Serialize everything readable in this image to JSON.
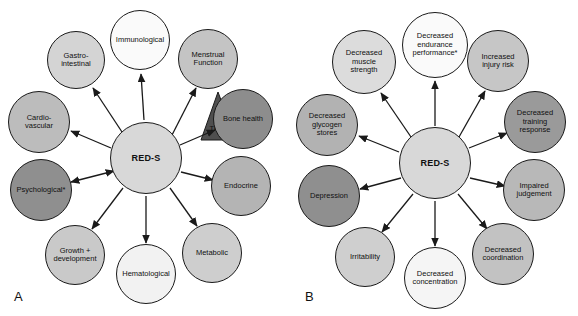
{
  "figure": {
    "type": "concept-diagram",
    "background_color": "#ffffff",
    "outline_color": "#1a1a1a"
  },
  "panels": [
    {
      "letter": "A",
      "letter_x": 14,
      "letter_y": 289,
      "center": {
        "label": "RED-S",
        "cx": 146,
        "cy": 158,
        "r": 36,
        "fill": "#d8d8d8",
        "font_size": 9
      },
      "overlay": {
        "name": "triad-triangle",
        "label": "Triad",
        "fill": "#4f4f4f",
        "text_color": "#1a1a1a",
        "points": "201,140 236,140 218,92",
        "label_x": 218,
        "label_y": 128,
        "font_size": 7.5
      },
      "nodes": [
        {
          "label": "Immunological",
          "cx": 140,
          "cy": 40,
          "r": 30,
          "fill": "#fafafa",
          "font_size": 7.5,
          "arrow": "single",
          "arrow_from": [
            144,
            120
          ],
          "arrow_to": [
            141,
            74
          ]
        },
        {
          "label": "Gastro-\nintestinal",
          "cx": 76,
          "cy": 60,
          "r": 29,
          "fill": "#d4d4d4",
          "font_size": 7.5,
          "arrow": "single",
          "arrow_from": [
            122,
            132
          ],
          "arrow_to": [
            93,
            88
          ]
        },
        {
          "label": "Cardio-\nvascular",
          "cx": 39,
          "cy": 122,
          "r": 31,
          "fill": "#bcbcbc",
          "font_size": 7.5,
          "arrow": "single",
          "arrow_from": [
            111,
            148
          ],
          "arrow_to": [
            71,
            131
          ]
        },
        {
          "label": "Psychological*",
          "cx": 41,
          "cy": 190,
          "r": 31,
          "fill": "#8f8f8f",
          "font_size": 7.5,
          "arrow": "double",
          "arrow_from": [
            71,
            182
          ],
          "arrow_to": [
            114,
            171
          ]
        },
        {
          "label": "Growth +\ndevelopment",
          "cx": 75,
          "cy": 255,
          "r": 30,
          "fill": "#c9c9c9",
          "font_size": 7.5,
          "arrow": "single",
          "arrow_from": [
            123,
            188
          ],
          "arrow_to": [
            92,
            229
          ]
        },
        {
          "label": "Hematological",
          "cx": 146,
          "cy": 274,
          "r": 30,
          "fill": "#f2f2f2",
          "font_size": 7.5,
          "arrow": "single",
          "arrow_from": [
            146,
            196
          ],
          "arrow_to": [
            146,
            243
          ]
        },
        {
          "label": "Metabolic",
          "cx": 212,
          "cy": 253,
          "r": 30,
          "fill": "#cecece",
          "font_size": 7.5,
          "arrow": "single",
          "arrow_from": [
            170,
            188
          ],
          "arrow_to": [
            197,
            226
          ]
        },
        {
          "label": "Endocrine",
          "cx": 241,
          "cy": 186,
          "r": 30,
          "fill": "#b4b4b4",
          "font_size": 7.5,
          "arrow": "single",
          "arrow_from": [
            181,
            172
          ],
          "arrow_to": [
            213,
            180
          ]
        },
        {
          "label": "Bone health",
          "cx": 243,
          "cy": 119,
          "r": 30,
          "fill": "#8d8d8d",
          "font_size": 7.5,
          "arrow": "single",
          "arrow_from": [
            180,
            145
          ],
          "arrow_to": [
            215,
            130
          ]
        },
        {
          "label": "Menstrual\nFunction",
          "cx": 208,
          "cy": 59,
          "r": 30,
          "fill": "#c4c4c4",
          "font_size": 7.5,
          "arrow": "single",
          "arrow_from": [
            171,
            137
          ],
          "arrow_to": [
            196,
            88
          ]
        }
      ]
    },
    {
      "letter": "B",
      "letter_x": 16,
      "letter_y": 289,
      "center": {
        "label": "RED-S",
        "cx": 146,
        "cy": 163,
        "r": 36,
        "fill": "#d8d8d8",
        "font_size": 9
      },
      "overlay": null,
      "nodes": [
        {
          "label": "Decreased\nendurance\nperformance*",
          "cx": 146,
          "cy": 45,
          "r": 33,
          "fill": "#fafafa",
          "font_size": 7.5,
          "arrow": "single",
          "arrow_from": [
            146,
            126
          ],
          "arrow_to": [
            146,
            81
          ]
        },
        {
          "label": "Decreased\nmuscle\nstrength",
          "cx": 75,
          "cy": 62,
          "r": 32,
          "fill": "#dcdcdc",
          "font_size": 7.5,
          "arrow": "single",
          "arrow_from": [
            122,
            137
          ],
          "arrow_to": [
            92,
            93
          ]
        },
        {
          "label": "Decreased\nglycogen\nstores",
          "cx": 38,
          "cy": 125,
          "r": 31,
          "fill": "#b2b2b2",
          "font_size": 7.5,
          "arrow": "single",
          "arrow_from": [
            110,
            152
          ],
          "arrow_to": [
            70,
            136
          ]
        },
        {
          "label": "Depression",
          "cx": 40,
          "cy": 196,
          "r": 31,
          "fill": "#8f8f8f",
          "font_size": 7.5,
          "arrow": "single",
          "arrow_from": [
            112,
            178
          ],
          "arrow_to": [
            71,
            189
          ]
        },
        {
          "label": "Irritability",
          "cx": 76,
          "cy": 257,
          "r": 30,
          "fill": "#cfcfcf",
          "font_size": 7.5,
          "arrow": "single",
          "arrow_from": [
            124,
            194
          ],
          "arrow_to": [
            93,
            232
          ]
        },
        {
          "label": "Decreased\nconcentration",
          "cx": 146,
          "cy": 278,
          "r": 31,
          "fill": "#f5f5f5",
          "font_size": 7.5,
          "arrow": "single",
          "arrow_from": [
            146,
            201
          ],
          "arrow_to": [
            146,
            246
          ]
        },
        {
          "label": "Decreased\ncoordination",
          "cx": 214,
          "cy": 254,
          "r": 31,
          "fill": "#c2c2c2",
          "font_size": 7.5,
          "arrow": "single",
          "arrow_from": [
            169,
            194
          ],
          "arrow_to": [
            198,
            229
          ]
        },
        {
          "label": "Impaired\njudgement",
          "cx": 245,
          "cy": 190,
          "r": 31,
          "fill": "#b8b8b8",
          "font_size": 7.5,
          "arrow": "single",
          "arrow_from": [
            181,
            178
          ],
          "arrow_to": [
            216,
            186
          ]
        },
        {
          "label": "Decreased\ntraining\nresponse",
          "cx": 246,
          "cy": 122,
          "r": 31,
          "fill": "#9a9a9a",
          "font_size": 7.5,
          "arrow": "single",
          "arrow_from": [
            180,
            148
          ],
          "arrow_to": [
            218,
            133
          ]
        },
        {
          "label": "Increased\ninjury risk",
          "cx": 209,
          "cy": 61,
          "r": 31,
          "fill": "#c6c6c6",
          "font_size": 7.5,
          "arrow": "single",
          "arrow_from": [
            170,
            137
          ],
          "arrow_to": [
            196,
            91
          ]
        }
      ]
    }
  ]
}
